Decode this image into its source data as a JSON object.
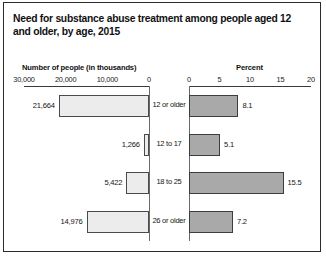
{
  "chart_data": {
    "type": "bar",
    "title": "Need for substance abuse treatment among people aged 12 and older, by age, 2015",
    "orientation": "horizontal",
    "layout": "paired-pyramid",
    "categories": [
      "12 or older",
      "12 to 17",
      "18 to 25",
      "26 or older"
    ],
    "panels": [
      {
        "id": "count",
        "position": "left",
        "axis_title": "Number of people (in thousands)",
        "tick_labels": [
          "30,000",
          "20,000",
          "10,000",
          "0"
        ],
        "tick_values": [
          30000,
          20000,
          10000,
          0
        ],
        "xlim": [
          30000,
          0
        ],
        "reversed": true,
        "grid": false,
        "bar_fill": "#ececed",
        "bar_border": "#4a4a4a",
        "values": [
          21664,
          1266,
          5422,
          14976
        ],
        "value_labels": [
          "21,664",
          "1,266",
          "5,422",
          "14,976"
        ]
      },
      {
        "id": "percent",
        "position": "right",
        "axis_title": "Percent",
        "tick_labels": [
          "0",
          "5",
          "10",
          "15",
          "20"
        ],
        "tick_values": [
          0,
          5,
          10,
          15,
          20
        ],
        "xlim": [
          0,
          20
        ],
        "reversed": false,
        "grid": false,
        "bar_fill": "#a9a9a9",
        "bar_border": "#3d3d3d",
        "values": [
          8.1,
          5.1,
          15.5,
          7.2
        ],
        "value_labels": [
          "8.1",
          "5.1",
          "15.5",
          "7.2"
        ]
      }
    ],
    "legend": null,
    "xlabel": "",
    "ylabel": ""
  },
  "colors": {
    "frame": "#2b2b2b",
    "axis": "#3a3a3a",
    "text": "#151515"
  }
}
